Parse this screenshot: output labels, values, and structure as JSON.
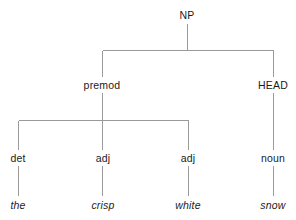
{
  "diagram": {
    "type": "syntax-tree",
    "background_color": "#ffffff",
    "line_color": "#9a9a9a",
    "text_color": "#1b1b1b",
    "nodes": {
      "root": {
        "label": "NP",
        "x": 187,
        "y": 15
      },
      "premod": {
        "label": "premod",
        "x": 102,
        "y": 85
      },
      "head": {
        "label": "HEAD",
        "x": 273,
        "y": 85
      },
      "det": {
        "label": "det",
        "x": 18,
        "y": 158
      },
      "adj1": {
        "label": "adj",
        "x": 103,
        "y": 158
      },
      "adj2": {
        "label": "adj",
        "x": 188,
        "y": 158
      },
      "noun": {
        "label": "noun",
        "x": 273,
        "y": 158
      }
    },
    "leaves": {
      "the": {
        "label": "the",
        "x": 18,
        "y": 205
      },
      "crisp": {
        "label": "crisp",
        "x": 103,
        "y": 205
      },
      "white": {
        "label": "white",
        "x": 188,
        "y": 205
      },
      "snow": {
        "label": "snow",
        "x": 273,
        "y": 205
      }
    },
    "sentence": "the crisp white snow"
  }
}
